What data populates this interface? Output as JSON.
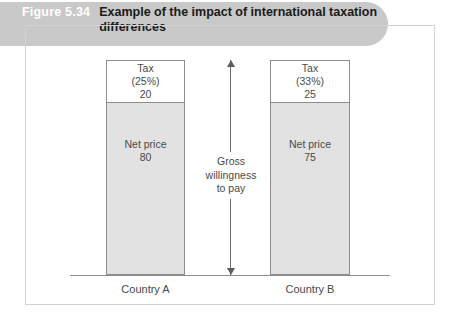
{
  "figure": {
    "number": "Figure 5.34",
    "title": "Example of the impact of international taxation differences"
  },
  "chart_data": {
    "type": "bar",
    "title": "Example of the impact of international taxation differences",
    "xlabel": "",
    "ylabel": "",
    "stacked": true,
    "grid": false,
    "legend": "none",
    "categories": [
      "Country A",
      "Country B"
    ],
    "series": [
      {
        "name": "Net price",
        "values": [
          80,
          75
        ]
      },
      {
        "name": "Tax",
        "values": [
          20,
          25
        ]
      }
    ],
    "tax_rates": [
      "(25%)",
      "(33%)"
    ],
    "totals": [
      100,
      100
    ],
    "annotation": "Gross willingness to pay",
    "annotation_lines": [
      "Gross",
      "willingness",
      "to pay"
    ]
  },
  "bars": [
    {
      "category": "Country A",
      "tax_label": "Tax",
      "tax_rate": "(25%)",
      "tax_value": "20",
      "net_label": "Net price",
      "net_value": "80"
    },
    {
      "category": "Country B",
      "tax_label": "Tax",
      "tax_rate": "(33%)",
      "tax_value": "25",
      "net_label": "Net price",
      "net_value": "75"
    }
  ],
  "annotation": {
    "line1": "Gross",
    "line2": "willingness",
    "line3": "to pay"
  },
  "colors": {
    "header_band": "#c9c9c9",
    "figure_number_text": "#ffffff",
    "title_text": "#1a1a1a",
    "net_price_fill": "#e2e2e2",
    "tax_fill": "#ffffff",
    "outline": "#8d8d8d",
    "frame": "#d2d2d2",
    "label_text": "#4a4a4a"
  }
}
